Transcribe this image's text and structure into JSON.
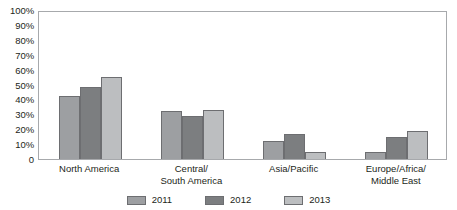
{
  "chart_data": {
    "type": "bar",
    "title": "",
    "subtitle": "",
    "xlabel": "",
    "ylabel": "",
    "ylim": [
      0,
      100
    ],
    "grid": false,
    "legend_position": "bottom",
    "categories": [
      [
        "North America"
      ],
      [
        "Central/",
        "South America"
      ],
      [
        "Asia/Pacific"
      ],
      [
        "Europe/Africa/",
        "Middle East"
      ]
    ],
    "ytick_labels": [
      "100%",
      "90%",
      "80%",
      "70%",
      "60%",
      "50%",
      "40%",
      "30%",
      "20%",
      "10%",
      "0"
    ],
    "ytick_values": [
      100,
      90,
      80,
      70,
      60,
      50,
      40,
      30,
      20,
      10,
      0
    ],
    "series": [
      {
        "name": "2011",
        "color": "#9d9fa2",
        "values": [
          42,
          32,
          12,
          5
        ]
      },
      {
        "name": "2012",
        "color": "#7c7e80",
        "values": [
          48,
          29,
          17,
          15
        ]
      },
      {
        "name": "2013",
        "color": "#bcbec0",
        "values": [
          55,
          33,
          5,
          19
        ]
      }
    ]
  },
  "legend": {
    "items": [
      {
        "label": "2011"
      },
      {
        "label": "2012"
      },
      {
        "label": "2013"
      }
    ]
  },
  "colors": {
    "series_2011": "#9d9fa2",
    "series_2012": "#7c7e80",
    "series_2013": "#bcbec0",
    "axis": "#a7a9ac",
    "bar_outline": "#6d6e71",
    "text": "#231f20",
    "background": "#ffffff"
  }
}
